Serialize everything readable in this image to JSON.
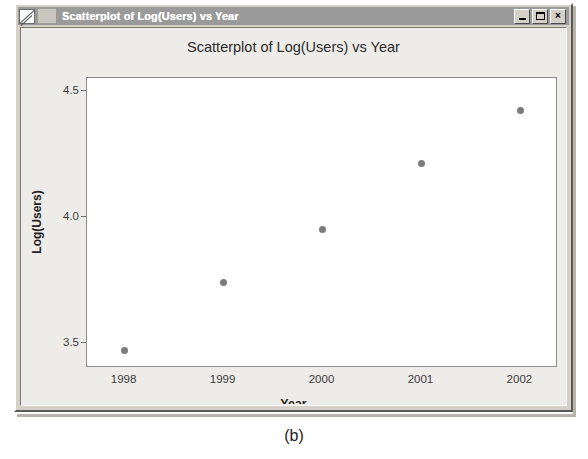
{
  "window": {
    "title": "Scatterplot of Log(Users) vs Year",
    "icon": "plot-document-icon",
    "buttons": {
      "minimize_label": "_",
      "maximize_label": "□",
      "close_label": "×"
    }
  },
  "figure": {
    "caption": "(b)"
  },
  "chart_data": {
    "type": "scatter",
    "title": "Scatterplot of Log(Users) vs Year",
    "xlabel": "Year",
    "ylabel": "Log(Users)",
    "x": [
      1998,
      1999,
      2000,
      2001,
      2002
    ],
    "values": [
      3.47,
      3.74,
      3.95,
      4.21,
      4.42
    ],
    "points": [
      {
        "x": 1998,
        "y": 3.47
      },
      {
        "x": 1999,
        "y": 3.74
      },
      {
        "x": 2000,
        "y": 3.95
      },
      {
        "x": 2001,
        "y": 4.21
      },
      {
        "x": 2002,
        "y": 4.42
      }
    ],
    "xtick_labels": [
      "1998",
      "1999",
      "2000",
      "2001",
      "2002"
    ],
    "xticks": [
      1998,
      1999,
      2000,
      2001,
      2002
    ],
    "ytick_labels": [
      "4.5",
      "4.0",
      "3.5"
    ],
    "yticks": [
      4.5,
      4.0,
      3.5
    ],
    "xlim": [
      1997.62,
      2002.38
    ],
    "ylim": [
      3.4,
      4.55
    ],
    "grid": false,
    "legend": null,
    "marker_color": "#7b7b7b",
    "plot_background": "#ffffff"
  },
  "colors": {
    "title_bar": "#9a9a9a",
    "window_face": "#d4d0c8",
    "plot_area": "#eeece9",
    "axis": "#8d8d8d",
    "marker": "#7b7b7b"
  }
}
